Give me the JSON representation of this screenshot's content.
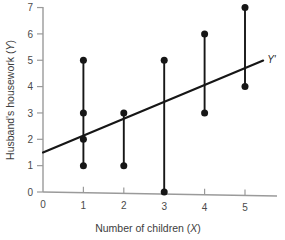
{
  "chart_data": {
    "type": "scatter",
    "title": "",
    "xlabel": "Number of children (X)",
    "ylabel": "Husband's housework (Y)",
    "xlim": [
      0,
      5.6
    ],
    "ylim": [
      0,
      7
    ],
    "xticks": [
      0,
      1,
      2,
      3,
      4,
      5
    ],
    "yticks": [
      0,
      1,
      2,
      3,
      4,
      5,
      6,
      7
    ],
    "xticklabels": [
      "0",
      "1",
      "2",
      "3",
      "4",
      "5"
    ],
    "yticklabels": [
      "0",
      "1",
      "2",
      "3",
      "4",
      "5",
      "6",
      "7"
    ],
    "grid": false,
    "legend": false,
    "points": [
      {
        "x": 1,
        "y": 1
      },
      {
        "x": 1,
        "y": 2
      },
      {
        "x": 1,
        "y": 3
      },
      {
        "x": 1,
        "y": 5
      },
      {
        "x": 2,
        "y": 1
      },
      {
        "x": 2,
        "y": 3
      },
      {
        "x": 3,
        "y": 0
      },
      {
        "x": 3,
        "y": 5
      },
      {
        "x": 4,
        "y": 3
      },
      {
        "x": 4,
        "y": 6
      },
      {
        "x": 5,
        "y": 4
      },
      {
        "x": 5,
        "y": 7
      }
    ],
    "residual_segments": [
      {
        "x": 1,
        "y_low": 1,
        "y_high": 5
      },
      {
        "x": 2,
        "y_low": 1,
        "y_high": 3
      },
      {
        "x": 3,
        "y_low": 0,
        "y_high": 5
      },
      {
        "x": 4,
        "y_low": 3,
        "y_high": 6
      },
      {
        "x": 5,
        "y_low": 4,
        "y_high": 7
      }
    ],
    "regression_line": {
      "label": "Y'",
      "intercept": 1.5,
      "slope": 0.64,
      "x_start": 0,
      "x_end": 5.45
    },
    "colors": {
      "axis": "#9a9a9a",
      "data": "#161616",
      "text": "#3d3d3d",
      "background": "#ffffff"
    }
  }
}
